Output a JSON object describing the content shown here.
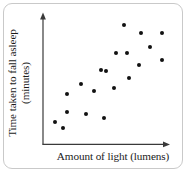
{
  "chart_data": {
    "type": "scatter",
    "title": "",
    "xlabel": "Amount of light (lumens)",
    "ylabel_line1": "Time taken to fall asleep",
    "ylabel_line2": "(minutes)",
    "ylabel": "Time taken to fall asleep (minutes)",
    "grid": false,
    "legend": "none",
    "axis_ticks": "none",
    "axis_style": "arrow-headed L-shaped axes, no tick marks, no numeric scale",
    "dot_color": "#111111",
    "axis_color": "#3a3a3a",
    "border_color": "#c9c9c9",
    "n_points": 20,
    "xlim": [
      0,
      100
    ],
    "ylim": [
      0,
      100
    ],
    "relationship": "positive correlation",
    "points_px": [
      {
        "x": 55.3,
        "y": 121.7
      },
      {
        "x": 63.0,
        "y": 127.7
      },
      {
        "x": 67.0,
        "y": 94.3
      },
      {
        "x": 67.3,
        "y": 111.7
      },
      {
        "x": 80.7,
        "y": 84.3
      },
      {
        "x": 86.3,
        "y": 114.0
      },
      {
        "x": 93.7,
        "y": 91.0
      },
      {
        "x": 100.7,
        "y": 69.7
      },
      {
        "x": 104.0,
        "y": 118.3
      },
      {
        "x": 106.0,
        "y": 71.0
      },
      {
        "x": 114.0,
        "y": 87.7
      },
      {
        "x": 116.0,
        "y": 53.3
      },
      {
        "x": 124.0,
        "y": 25.0
      },
      {
        "x": 126.7,
        "y": 53.0
      },
      {
        "x": 129.3,
        "y": 78.3
      },
      {
        "x": 139.3,
        "y": 65.0
      },
      {
        "x": 141.3,
        "y": 33.3
      },
      {
        "x": 150.3,
        "y": 47.3
      },
      {
        "x": 161.7,
        "y": 60.3
      },
      {
        "x": 162.3,
        "y": 33.0
      }
    ],
    "points": [
      {
        "x": 10.4,
        "y": 18.4
      },
      {
        "x": 16.4,
        "y": 13.8
      },
      {
        "x": 19.5,
        "y": 39.5
      },
      {
        "x": 19.8,
        "y": 26.1
      },
      {
        "x": 30.2,
        "y": 47.1
      },
      {
        "x": 34.6,
        "y": 24.3
      },
      {
        "x": 40.4,
        "y": 42.1
      },
      {
        "x": 45.8,
        "y": 58.5
      },
      {
        "x": 48.4,
        "y": 21.1
      },
      {
        "x": 50.0,
        "y": 57.5
      },
      {
        "x": 56.3,
        "y": 70.3
      },
      {
        "x": 57.8,
        "y": 96.7
      },
      {
        "x": 64.1,
        "y": 118.5
      },
      {
        "x": 66.2,
        "y": 96.9
      },
      {
        "x": 68.2,
        "y": 77.5
      },
      {
        "x": 76.0,
        "y": 87.7
      },
      {
        "x": 77.6,
        "y": 112.1
      },
      {
        "x": 84.6,
        "y": 101.3
      },
      {
        "x": 93.5,
        "y": 91.3
      },
      {
        "x": 94.0,
        "y": 112.3
      }
    ]
  }
}
